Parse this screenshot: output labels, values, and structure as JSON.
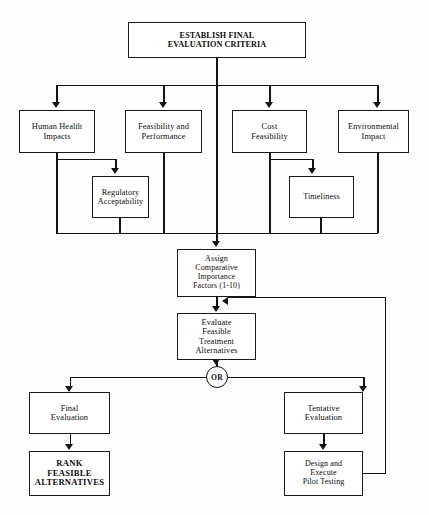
{
  "diagram": {
    "line_color": "#141414",
    "box_border_color": "#1a1a1a",
    "background": "#fdfdfd"
  },
  "nodes": {
    "establish": {
      "label": "ESTABLISH FINAL\nEVALUATION CRITERIA"
    },
    "human_health": {
      "label": "Human Health\nImpacts"
    },
    "feasibility_performance": {
      "label": "Feasibility and\nPerformance"
    },
    "cost_feasibility": {
      "label": "Cost\nFeasibility"
    },
    "environmental_impact": {
      "label": "Environmental\nImpact"
    },
    "regulatory_acceptability": {
      "label": "Regulatory\nAcceptability"
    },
    "timeliness": {
      "label": "Timeliness"
    },
    "assign_factors": {
      "label": "Assign\nComparative\nImportance\nFactors (1-10)"
    },
    "evaluate_alternatives": {
      "label": "Evaluate\nFeasible\nTreatment\nAlternatives"
    },
    "or_gate": {
      "label": "OR"
    },
    "final_evaluation": {
      "label": "Final\nEvaluation"
    },
    "tentative_evaluation": {
      "label": "Tentative\nEvaluation"
    },
    "rank_feasible": {
      "label": "RANK\nFEASIBLE\nALTERNATIVES"
    },
    "design_execute": {
      "label": "Design and\nExecute\nPilot Testing"
    }
  }
}
